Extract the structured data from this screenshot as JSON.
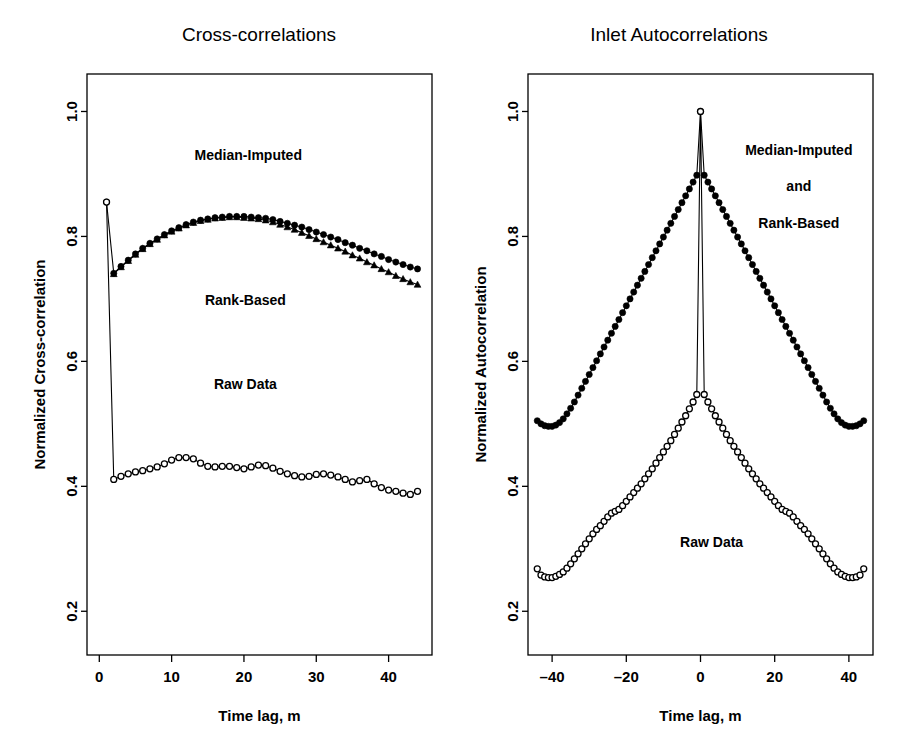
{
  "figure": {
    "background": "#ffffff",
    "foreground": "#000000",
    "width": 900,
    "height": 744
  },
  "chart_data": [
    {
      "id": "cross-correlations",
      "type": "line",
      "title": "Cross-correlations",
      "xlabel": "Time lag, m",
      "ylabel": "Normalized Cross-correlation",
      "xlim": [
        -1.7,
        46.0
      ],
      "ylim": [
        0.13,
        1.06
      ],
      "xticks": [
        0,
        10,
        20,
        30,
        40
      ],
      "xticklabels": [
        "0",
        "10",
        "20",
        "30",
        "40"
      ],
      "yticks": [
        0.2,
        0.4,
        0.6,
        0.8,
        1.0
      ],
      "yticklabels": [
        "0.2",
        "0.4",
        "0.6",
        "0.8",
        "1.0"
      ],
      "grid": false,
      "legend": "inline-annotations",
      "annotations": [
        {
          "text": "Median-Imputed",
          "x": 20.6,
          "y": 0.922
        },
        {
          "text": "Rank-Based",
          "x": 20.2,
          "y": 0.69
        },
        {
          "text": "Raw Data",
          "x": 20.2,
          "y": 0.556
        }
      ],
      "series": [
        {
          "name": "Median-Imputed",
          "marker": "filled-circle",
          "x": [
            1,
            2,
            3,
            4,
            5,
            6,
            7,
            8,
            9,
            10,
            11,
            12,
            13,
            14,
            15,
            16,
            17,
            18,
            19,
            20,
            21,
            22,
            23,
            24,
            25,
            26,
            27,
            28,
            29,
            30,
            31,
            32,
            33,
            34,
            35,
            36,
            37,
            38,
            39,
            40,
            41,
            42,
            43,
            44
          ],
          "y": [
            0.855,
            0.741,
            0.752,
            0.762,
            0.772,
            0.781,
            0.789,
            0.796,
            0.803,
            0.809,
            0.814,
            0.819,
            0.823,
            0.826,
            0.828,
            0.83,
            0.831,
            0.832,
            0.832,
            0.832,
            0.831,
            0.83,
            0.829,
            0.827,
            0.824,
            0.821,
            0.818,
            0.815,
            0.811,
            0.807,
            0.803,
            0.799,
            0.795,
            0.79,
            0.786,
            0.781,
            0.777,
            0.772,
            0.768,
            0.763,
            0.759,
            0.755,
            0.751,
            0.748
          ]
        },
        {
          "name": "Rank-Based",
          "marker": "filled-triangle",
          "x": [
            2,
            3,
            4,
            5,
            6,
            7,
            8,
            9,
            10,
            11,
            12,
            13,
            14,
            15,
            16,
            17,
            18,
            19,
            20,
            21,
            22,
            23,
            24,
            25,
            26,
            27,
            28,
            29,
            30,
            31,
            32,
            33,
            34,
            35,
            36,
            37,
            38,
            39,
            40,
            41,
            42,
            43,
            44
          ],
          "y": [
            0.74,
            0.751,
            0.761,
            0.771,
            0.78,
            0.788,
            0.795,
            0.802,
            0.808,
            0.813,
            0.818,
            0.822,
            0.825,
            0.827,
            0.829,
            0.83,
            0.831,
            0.831,
            0.83,
            0.829,
            0.828,
            0.826,
            0.823,
            0.819,
            0.815,
            0.811,
            0.806,
            0.801,
            0.796,
            0.791,
            0.786,
            0.781,
            0.776,
            0.77,
            0.765,
            0.759,
            0.754,
            0.748,
            0.743,
            0.737,
            0.732,
            0.727,
            0.723
          ]
        },
        {
          "name": "Raw Data",
          "marker": "open-circle",
          "x": [
            1,
            2,
            3,
            4,
            5,
            6,
            7,
            8,
            9,
            10,
            11,
            12,
            13,
            14,
            15,
            16,
            17,
            18,
            19,
            20,
            21,
            22,
            23,
            24,
            25,
            26,
            27,
            28,
            29,
            30,
            31,
            32,
            33,
            34,
            35,
            36,
            37,
            38,
            39,
            40,
            41,
            42,
            43,
            44
          ],
          "y": [
            0.855,
            0.411,
            0.416,
            0.42,
            0.423,
            0.425,
            0.428,
            0.431,
            0.436,
            0.442,
            0.446,
            0.446,
            0.444,
            0.437,
            0.432,
            0.431,
            0.432,
            0.432,
            0.43,
            0.428,
            0.431,
            0.434,
            0.433,
            0.429,
            0.424,
            0.42,
            0.417,
            0.415,
            0.416,
            0.419,
            0.42,
            0.418,
            0.415,
            0.411,
            0.407,
            0.409,
            0.411,
            0.404,
            0.398,
            0.394,
            0.392,
            0.389,
            0.387,
            0.392
          ]
        }
      ]
    },
    {
      "id": "inlet-autocorrelations",
      "type": "line",
      "title": "Inlet Autocorrelations",
      "xlabel": "Time lag, m",
      "ylabel": "Normalized Autocorrelation",
      "xlim": [
        -46.5,
        46.5
      ],
      "ylim": [
        0.13,
        1.06
      ],
      "xticks": [
        -40,
        -20,
        0,
        20,
        40
      ],
      "xticklabels": [
        "–40",
        "–20",
        "0",
        "20",
        "40"
      ],
      "yticks": [
        0.2,
        0.4,
        0.6,
        0.8,
        1.0
      ],
      "yticklabels": [
        "0.2",
        "0.4",
        "0.6",
        "0.8",
        "1.0"
      ],
      "grid": false,
      "legend": "inline-annotations",
      "annotations": [
        {
          "text": "Median-Imputed",
          "x": 26.5,
          "y": 0.93
        },
        {
          "text": "and",
          "x": 26.5,
          "y": 0.872
        },
        {
          "text": "Rank-Based",
          "x": 26.5,
          "y": 0.814
        },
        {
          "text": "Raw Data",
          "x": 3.0,
          "y": 0.303
        }
      ],
      "series": [
        {
          "name": "Median-Imputed and Rank-Based",
          "marker": "filled-circle",
          "x": [
            -44,
            -43,
            -42,
            -41,
            -40,
            -39,
            -38,
            -37,
            -36,
            -35,
            -34,
            -33,
            -32,
            -31,
            -30,
            -29,
            -28,
            -27,
            -26,
            -25,
            -24,
            -23,
            -22,
            -21,
            -20,
            -19,
            -18,
            -17,
            -16,
            -15,
            -14,
            -13,
            -12,
            -11,
            -10,
            -9,
            -8,
            -7,
            -6,
            -5,
            -4,
            -3,
            -2,
            -1,
            0,
            1,
            2,
            3,
            4,
            5,
            6,
            7,
            8,
            9,
            10,
            11,
            12,
            13,
            14,
            15,
            16,
            17,
            18,
            19,
            20,
            21,
            22,
            23,
            24,
            25,
            26,
            27,
            28,
            29,
            30,
            31,
            32,
            33,
            34,
            35,
            36,
            37,
            38,
            39,
            40,
            41,
            42,
            43,
            44
          ],
          "y": [
            0.505,
            0.5,
            0.497,
            0.496,
            0.496,
            0.498,
            0.502,
            0.508,
            0.516,
            0.525,
            0.535,
            0.546,
            0.557,
            0.568,
            0.579,
            0.59,
            0.601,
            0.612,
            0.623,
            0.634,
            0.645,
            0.656,
            0.667,
            0.678,
            0.689,
            0.7,
            0.711,
            0.722,
            0.733,
            0.744,
            0.755,
            0.766,
            0.777,
            0.788,
            0.799,
            0.81,
            0.821,
            0.832,
            0.843,
            0.854,
            0.865,
            0.876,
            0.887,
            0.898,
            1.0,
            0.898,
            0.887,
            0.876,
            0.865,
            0.854,
            0.843,
            0.832,
            0.821,
            0.81,
            0.799,
            0.788,
            0.777,
            0.766,
            0.755,
            0.744,
            0.733,
            0.722,
            0.711,
            0.7,
            0.689,
            0.678,
            0.667,
            0.656,
            0.645,
            0.634,
            0.623,
            0.612,
            0.601,
            0.59,
            0.579,
            0.568,
            0.557,
            0.546,
            0.535,
            0.525,
            0.516,
            0.508,
            0.502,
            0.498,
            0.496,
            0.496,
            0.497,
            0.5,
            0.505
          ]
        },
        {
          "name": "Raw Data",
          "marker": "open-circle",
          "x": [
            -44,
            -43,
            -42,
            -41,
            -40,
            -39,
            -38,
            -37,
            -36,
            -35,
            -34,
            -33,
            -32,
            -31,
            -30,
            -29,
            -28,
            -27,
            -26,
            -25,
            -24,
            -23,
            -22,
            -21,
            -20,
            -19,
            -18,
            -17,
            -16,
            -15,
            -14,
            -13,
            -12,
            -11,
            -10,
            -9,
            -8,
            -7,
            -6,
            -5,
            -4,
            -3,
            -2,
            -1,
            0,
            1,
            2,
            3,
            4,
            5,
            6,
            7,
            8,
            9,
            10,
            11,
            12,
            13,
            14,
            15,
            16,
            17,
            18,
            19,
            20,
            21,
            22,
            23,
            24,
            25,
            26,
            27,
            28,
            29,
            30,
            31,
            32,
            33,
            34,
            35,
            36,
            37,
            38,
            39,
            40,
            41,
            42,
            43,
            44
          ],
          "y": [
            0.268,
            0.258,
            0.255,
            0.254,
            0.254,
            0.256,
            0.259,
            0.263,
            0.269,
            0.276,
            0.284,
            0.292,
            0.3,
            0.308,
            0.316,
            0.324,
            0.331,
            0.337,
            0.344,
            0.351,
            0.357,
            0.36,
            0.363,
            0.369,
            0.376,
            0.383,
            0.39,
            0.397,
            0.404,
            0.412,
            0.42,
            0.428,
            0.437,
            0.446,
            0.455,
            0.464,
            0.473,
            0.483,
            0.493,
            0.503,
            0.513,
            0.524,
            0.535,
            0.547,
            1.0,
            0.547,
            0.535,
            0.524,
            0.513,
            0.503,
            0.493,
            0.483,
            0.473,
            0.464,
            0.455,
            0.446,
            0.437,
            0.428,
            0.42,
            0.412,
            0.404,
            0.397,
            0.39,
            0.383,
            0.376,
            0.369,
            0.363,
            0.36,
            0.357,
            0.351,
            0.344,
            0.337,
            0.331,
            0.324,
            0.316,
            0.308,
            0.3,
            0.292,
            0.284,
            0.276,
            0.269,
            0.263,
            0.259,
            0.256,
            0.254,
            0.254,
            0.255,
            0.258,
            0.268
          ]
        }
      ]
    }
  ]
}
